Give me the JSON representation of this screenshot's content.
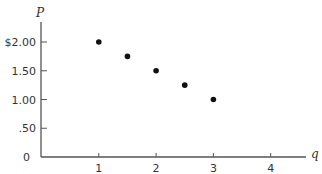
{
  "chart_data": {
    "type": "scatter",
    "title": "",
    "xlabel": "q",
    "ylabel": "P",
    "x": [
      1,
      1.5,
      2,
      2.5,
      3
    ],
    "values": [
      2.0,
      1.75,
      1.5,
      1.25,
      1.0
    ],
    "series": [
      {
        "name": "points",
        "x": [
          1,
          1.5,
          2,
          2.5,
          3
        ],
        "values": [
          2.0,
          1.75,
          1.5,
          1.25,
          1.0
        ]
      }
    ],
    "xlim": [
      0,
      4.6
    ],
    "ylim": [
      0,
      2.25
    ],
    "x_ticks": [
      1,
      2,
      3,
      4
    ],
    "x_tick_labels": [
      "1",
      "2",
      "3",
      "4"
    ],
    "y_ticks": [
      0.5,
      1.0,
      1.5,
      2.0
    ],
    "y_tick_labels": [
      ".50",
      "1.00",
      "1.50",
      "$2.00"
    ],
    "origin_label": "0",
    "grid": false,
    "legend": null,
    "colors": {
      "axis": "#555555",
      "points": "#111111",
      "text": "#333333"
    }
  }
}
